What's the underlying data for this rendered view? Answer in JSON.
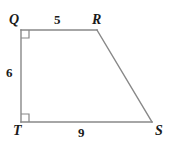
{
  "figure": {
    "kind": "right-trapezoid",
    "name": "QRST",
    "background_color": "#ffffff",
    "stroke_color": "#888888",
    "text_color": "#1a1a1a",
    "stroke_width": 1.4,
    "vertices": {
      "Q": {
        "label": "Q",
        "x": 21,
        "y": 30
      },
      "R": {
        "label": "R",
        "x": 97,
        "y": 30
      },
      "S": {
        "label": "S",
        "x": 152,
        "y": 122
      },
      "T": {
        "label": "T",
        "x": 21,
        "y": 122
      }
    },
    "sides": [
      {
        "id": "QR",
        "from": "Q",
        "to": "R",
        "measure": "5"
      },
      {
        "id": "RS",
        "from": "R",
        "to": "S",
        "measure": ""
      },
      {
        "id": "ST",
        "from": "S",
        "to": "T",
        "measure": "9"
      },
      {
        "id": "TQ",
        "from": "T",
        "to": "Q",
        "measure": "6"
      }
    ],
    "right_angles": [
      {
        "at": "Q",
        "marker": "square",
        "size": 8
      },
      {
        "at": "T",
        "marker": "square",
        "size": 8
      }
    ],
    "measures": {
      "top": "5",
      "left": "6",
      "bottom": "9"
    }
  }
}
